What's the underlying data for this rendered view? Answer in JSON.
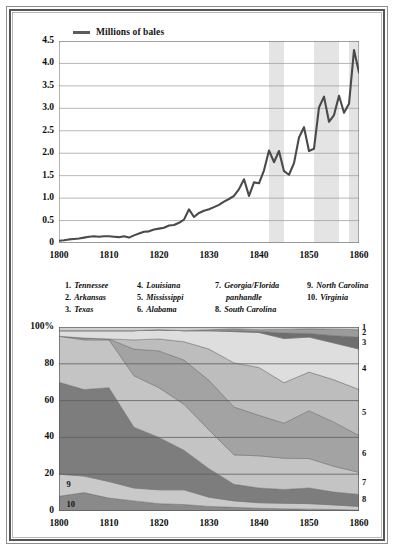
{
  "figure": {
    "frame": "double-ruled-border"
  },
  "line_chart": {
    "legend_label": "Millions of bales",
    "legend_color": "#5c5c5c"
  },
  "key": {
    "columns": [
      {
        "items": [
          {
            "num": "1.",
            "name": "Tennessee"
          },
          {
            "num": "2.",
            "name": "Arkansas"
          },
          {
            "num": "3.",
            "name": "Texas"
          }
        ]
      },
      {
        "items": [
          {
            "num": "4.",
            "name": "Louisiana"
          },
          {
            "num": "5.",
            "name": "Mississippi"
          },
          {
            "num": "6.",
            "name": "Alabama"
          }
        ]
      },
      {
        "items": [
          {
            "num": "7.",
            "name": "Georgia/Florida"
          },
          {
            "num": "",
            "name": "panhandle",
            "continuation": true
          },
          {
            "num": "8.",
            "name": "South Carolina"
          }
        ]
      },
      {
        "items": [
          {
            "num": "9.",
            "name": "North Carolina"
          },
          {
            "num": "10.",
            "name": "Virginia"
          }
        ]
      }
    ]
  },
  "area_chart": {
    "top_label": "100%",
    "inline_labels": [
      {
        "text": "9",
        "x_year": 1801.5,
        "y_pct": 14
      },
      {
        "text": "10",
        "x_year": 1801.5,
        "y_pct": 3.5
      }
    ],
    "right_labels": [
      "1",
      "2",
      "3",
      "4",
      "5",
      "6",
      "7",
      "8"
    ]
  },
  "chart_data": [
    {
      "type": "line",
      "title": "",
      "subtitle": "",
      "xlabel": "",
      "ylabel": "Millions of bales",
      "xlim": [
        1800,
        1860
      ],
      "ylim": [
        0,
        4.5
      ],
      "grid": true,
      "legend": [
        "Millions of bales"
      ],
      "legend_position": "top-left",
      "xticks": [
        1800,
        1810,
        1820,
        1830,
        1840,
        1850,
        1860
      ],
      "xtick_labels": [
        "1800",
        "1810",
        "1820",
        "1830",
        "1840",
        "1850",
        "1860"
      ],
      "yticks": [
        0,
        0.5,
        1.0,
        1.5,
        2.0,
        2.5,
        3.0,
        3.5,
        4.0,
        4.5
      ],
      "ytick_labels": [
        "0",
        "0.5",
        "1.0",
        "1.5",
        "2.0",
        "2.5",
        "3.0",
        "3.5",
        "4.0",
        "4.5"
      ],
      "minor_xticks": [
        1805,
        1815,
        1825,
        1835,
        1845,
        1855
      ],
      "line_color": "#4a4a4a",
      "shaded_bands": [
        {
          "from": 1842,
          "to": 1845,
          "color": "#e4e4e4",
          "note": "panic/recession band"
        },
        {
          "from": 1851,
          "to": 1856,
          "color": "#e4e4e4",
          "note": "panic/recession band"
        },
        {
          "from": 1858,
          "to": 1860,
          "color": "#e4e4e4",
          "note": "panic/recession band"
        }
      ],
      "x": [
        1800,
        1801,
        1802,
        1803,
        1804,
        1805,
        1806,
        1807,
        1808,
        1809,
        1810,
        1811,
        1812,
        1813,
        1814,
        1815,
        1816,
        1817,
        1818,
        1819,
        1820,
        1821,
        1822,
        1823,
        1824,
        1825,
        1826,
        1827,
        1828,
        1829,
        1830,
        1831,
        1832,
        1833,
        1834,
        1835,
        1836,
        1837,
        1838,
        1839,
        1840,
        1841,
        1842,
        1843,
        1844,
        1845,
        1846,
        1847,
        1848,
        1849,
        1850,
        1851,
        1852,
        1853,
        1854,
        1855,
        1856,
        1857,
        1858,
        1859,
        1860
      ],
      "values": [
        0.05,
        0.06,
        0.08,
        0.09,
        0.1,
        0.12,
        0.14,
        0.15,
        0.14,
        0.15,
        0.15,
        0.14,
        0.13,
        0.15,
        0.12,
        0.17,
        0.21,
        0.25,
        0.26,
        0.3,
        0.32,
        0.34,
        0.39,
        0.4,
        0.45,
        0.52,
        0.75,
        0.58,
        0.67,
        0.72,
        0.75,
        0.8,
        0.85,
        0.92,
        0.98,
        1.05,
        1.2,
        1.42,
        1.05,
        1.35,
        1.33,
        1.62,
        2.06,
        1.8,
        2.05,
        1.6,
        1.52,
        1.78,
        2.35,
        2.58,
        2.05,
        2.1,
        3.02,
        3.26,
        2.7,
        2.85,
        3.28,
        2.9,
        3.1,
        4.3,
        3.8
      ]
    },
    {
      "type": "area",
      "stacked": true,
      "normalized": true,
      "title": "",
      "xlabel": "",
      "ylabel": "",
      "xlim": [
        1800,
        1860
      ],
      "ylim": [
        0,
        100
      ],
      "grid": true,
      "xticks": [
        1800,
        1810,
        1820,
        1830,
        1840,
        1850,
        1860
      ],
      "xtick_labels": [
        "1800",
        "1810",
        "1820",
        "1830",
        "1840",
        "1850",
        "1860"
      ],
      "minor_xticks": [
        1805,
        1815,
        1825,
        1835,
        1845,
        1855
      ],
      "yticks": [
        0,
        20,
        40,
        60,
        80,
        100
      ],
      "ytick_labels": [
        "0",
        "20",
        "40",
        "60",
        "80",
        "100%"
      ],
      "x": [
        1800,
        1805,
        1810,
        1815,
        1820,
        1825,
        1830,
        1835,
        1840,
        1845,
        1850,
        1855,
        1860
      ],
      "series": [
        {
          "name": "Virginia",
          "key": "10",
          "color": "#8a8a8a",
          "values": [
            8,
            10,
            7,
            5.5,
            4,
            3.5,
            2.5,
            2,
            1.5,
            1.2,
            1,
            0.8,
            0.5
          ]
        },
        {
          "name": "North Carolina",
          "key": "9",
          "color": "#c9c9c9",
          "values": [
            12,
            9,
            9,
            7,
            7.5,
            8,
            5,
            3.5,
            3,
            3,
            3,
            2.5,
            2
          ]
        },
        {
          "name": "South Carolina",
          "key": "8",
          "color": "#7d7d7d",
          "values": [
            50,
            47,
            51,
            33,
            28.5,
            21.5,
            15.5,
            9,
            8,
            7.5,
            8.5,
            7,
            6.5
          ]
        },
        {
          "name": "Georgia/Florida panhandle",
          "key": "7",
          "color": "#c4c4c4",
          "values": [
            25,
            27,
            26,
            28,
            27,
            25,
            21,
            16,
            17.5,
            17,
            16,
            14,
            12
          ]
        },
        {
          "name": "Alabama",
          "key": "6",
          "color": "#a3a3a3",
          "values": [
            0,
            1,
            0.5,
            14.5,
            20,
            24,
            27,
            26,
            22,
            19,
            26,
            24,
            20
          ]
        },
        {
          "name": "Mississippi",
          "key": "5",
          "color": "#bdbdbd",
          "values": [
            0,
            0,
            0,
            5,
            6.5,
            10,
            17,
            24,
            26,
            22,
            21,
            23,
            25
          ]
        },
        {
          "name": "Louisiana",
          "key": "4",
          "color": "#dedede",
          "values": [
            3,
            4,
            4.5,
            5,
            5,
            6,
            10,
            17,
            19,
            24,
            19,
            20,
            22
          ]
        },
        {
          "name": "Texas",
          "key": "3",
          "color": "#6f6f6f",
          "values": [
            0,
            0,
            0,
            0,
            0,
            0,
            0,
            0.5,
            0.5,
            3,
            2,
            4,
            6.5
          ]
        },
        {
          "name": "Arkansas",
          "key": "2",
          "color": "#9b9b9b",
          "values": [
            0,
            0,
            0,
            0,
            0,
            0,
            0.5,
            1,
            1,
            2,
            2.5,
            3.5,
            4
          ]
        },
        {
          "name": "Tennessee",
          "key": "1",
          "color": "#cfcfcf",
          "values": [
            2,
            2,
            2,
            2,
            1.5,
            2,
            1.5,
            1,
            1.5,
            1.3,
            1,
            1.2,
            1.5
          ]
        }
      ]
    }
  ]
}
